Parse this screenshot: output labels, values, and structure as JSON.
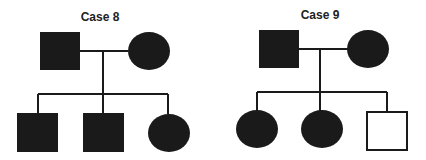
{
  "figure": {
    "type": "pedigree-charts",
    "colors": {
      "affected": "#1a1a1a",
      "unaffected": "#ffffff",
      "line": "#1a1a1a"
    },
    "pedigrees": [
      {
        "title": "Case 8",
        "parents": [
          {
            "sex": "male",
            "affected": true
          },
          {
            "sex": "female",
            "affected": true
          }
        ],
        "children": [
          {
            "sex": "male",
            "affected": true
          },
          {
            "sex": "male",
            "affected": true
          },
          {
            "sex": "female",
            "affected": true
          }
        ]
      },
      {
        "title": "Case 9",
        "parents": [
          {
            "sex": "male",
            "affected": true
          },
          {
            "sex": "female",
            "affected": true
          }
        ],
        "children": [
          {
            "sex": "female",
            "affected": true
          },
          {
            "sex": "female",
            "affected": true
          },
          {
            "sex": "male",
            "affected": false
          }
        ]
      }
    ]
  }
}
